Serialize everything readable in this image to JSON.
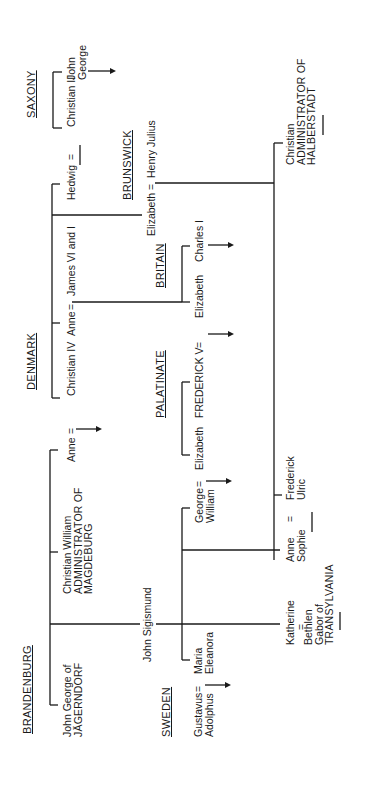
{
  "diagram": {
    "type": "genealogy",
    "orientation": "rotated-90-ccw",
    "houses": {
      "saxony": "SAXONY",
      "denmark": "DENMARK",
      "brunswick": "BRUNSWICK",
      "britain": "BRITAIN",
      "palatinate": "PALATINATE",
      "brandenburg": "BRANDENBURG",
      "sweden": "SWEDEN"
    },
    "people": {
      "christian_ii": "Christian II",
      "john_george_saxony": [
        "John",
        "George"
      ],
      "hedwig": "Hedwig",
      "eq1": "=",
      "christian_iv": "Christian IV",
      "anne_denmark": "Anne",
      "eq2": "=",
      "james": "James VI and I",
      "elizabeth_brunswick": "Elizabeth",
      "eq3": "=",
      "henry_julius": "Henry Julius",
      "christian_halberstadt": [
        "Christian",
        "ADMINISTRATOR OF",
        "HALBERSTADT"
      ],
      "charles_i": "Charles I",
      "elizabeth_britain": "Elizabeth",
      "eq4": "=",
      "frederick_v": "FREDERICK V",
      "elizabeth_palatinate": "Elizabeth",
      "eq5": "=",
      "george_william": [
        "George",
        "William"
      ],
      "anne_brandenburg": "Anne",
      "eq6": "=",
      "christian_william": [
        "Christian William",
        "ADMINISTRATOR OF",
        "MAGDEBURG"
      ],
      "frederick_ulric": [
        "Frederick",
        "Ulric"
      ],
      "anne_sophie": [
        "Anne",
        "Sophie"
      ],
      "eq7": "=",
      "john_sigismund": "John Sigismund",
      "katherine": "Katherine",
      "eq8": "=",
      "bethlen": [
        "Bethlen",
        "Gabor of",
        "TRANSYLVANIA"
      ],
      "john_george_jagerndorf": [
        "John George of",
        "JÄGERNDORF"
      ],
      "maria_eleanora": [
        "Maria",
        "Eleanora"
      ],
      "gustavus": [
        "Gustavus",
        "Adolphus"
      ],
      "eq9": "="
    }
  }
}
